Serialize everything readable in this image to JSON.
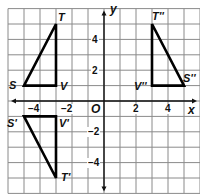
{
  "diagram": {
    "type": "coordinate-plane",
    "axes": {
      "x_label": "x",
      "y_label": "y",
      "origin_label": "O"
    },
    "x_ticks": [
      {
        "value": -4,
        "label": "−4"
      },
      {
        "value": -2,
        "label": "−2"
      },
      {
        "value": 2,
        "label": "2"
      },
      {
        "value": 4,
        "label": "4"
      }
    ],
    "y_ticks": [
      {
        "value": 4,
        "label": "4"
      },
      {
        "value": 2,
        "label": "2"
      },
      {
        "value": -2,
        "label": "−2"
      },
      {
        "value": -4,
        "label": "−4"
      }
    ],
    "grid": {
      "x_range": [
        -6,
        6
      ],
      "y_range": [
        -6,
        6
      ]
    },
    "triangles": [
      {
        "name": "STV",
        "vertices": [
          {
            "label": "S",
            "x": -5,
            "y": 1
          },
          {
            "label": "T",
            "x": -3,
            "y": 5
          },
          {
            "label": "V",
            "x": -3,
            "y": 1
          }
        ]
      },
      {
        "name": "S'T'V'",
        "vertices": [
          {
            "label": "S'",
            "x": -5,
            "y": -1
          },
          {
            "label": "T'",
            "x": -3,
            "y": -5
          },
          {
            "label": "V'",
            "x": -3,
            "y": -1
          }
        ]
      },
      {
        "name": "S''T''V''",
        "vertices": [
          {
            "label": "S''",
            "x": 5,
            "y": 1
          },
          {
            "label": "T''",
            "x": 3,
            "y": 5
          },
          {
            "label": "V''",
            "x": 3,
            "y": 1
          }
        ]
      }
    ],
    "colors": {
      "grid": "#8a8a8a",
      "axis": "#111111",
      "triangle": "#000000",
      "background": "#ffffff"
    }
  }
}
